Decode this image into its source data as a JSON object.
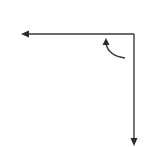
{
  "diagram": {
    "colors": {
      "background": "#ffffff",
      "stroke": "#3a3a3a"
    },
    "corner": {
      "x": 134,
      "y": 34
    },
    "axes": [
      {
        "name": "horizontal-axis",
        "direction": "left",
        "from": {
          "x": 134,
          "y": 34
        },
        "to": {
          "x": 19,
          "y": 34
        }
      },
      {
        "name": "vertical-axis",
        "direction": "down",
        "from": {
          "x": 134,
          "y": 34
        },
        "to": {
          "x": 134,
          "y": 146
        }
      }
    ],
    "rotation_arrow": {
      "direction": "counterclockwise",
      "from": {
        "x": 125,
        "y": 58
      },
      "to": {
        "x": 106,
        "y": 39
      }
    }
  }
}
